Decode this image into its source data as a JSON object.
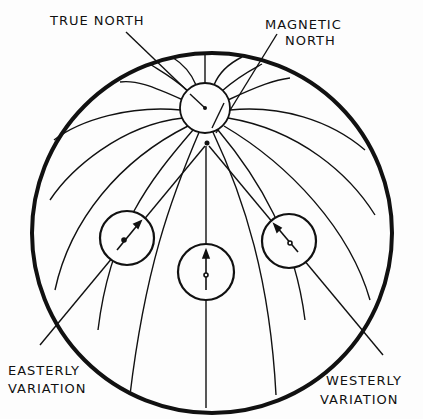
{
  "diagram": {
    "labels": {
      "true_north": "TRUE NORTH",
      "magnetic_north_line1": "MAGNETIC",
      "magnetic_north_line2": "NORTH",
      "easterly_line1": "EASTERLY",
      "easterly_line2": "VARIATION",
      "westerly_line1": "WESTERLY",
      "westerly_line2": "VARIATION"
    },
    "compasses": [
      {
        "position": "left",
        "needle": "points northeast"
      },
      {
        "position": "center",
        "needle": "points north"
      },
      {
        "position": "right",
        "needle": "points northwest"
      }
    ],
    "colors": {
      "ink": "#111111",
      "background": "#fdfdfd"
    }
  }
}
